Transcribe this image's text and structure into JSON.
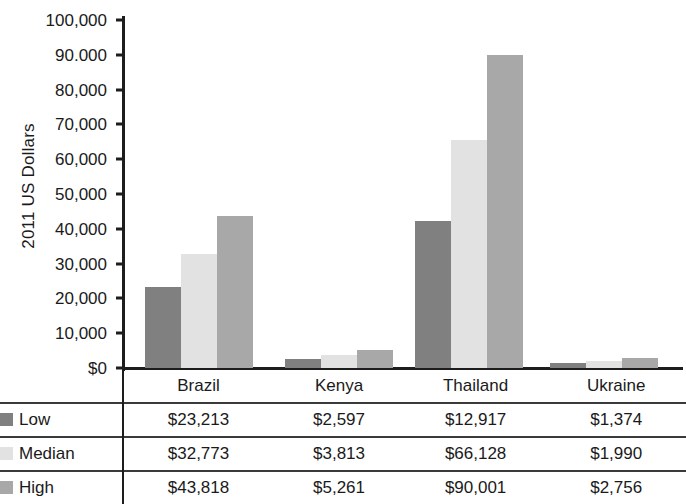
{
  "chart_data": {
    "type": "bar",
    "title": "",
    "subtitle": "",
    "xlabel": "",
    "ylabel": "2011 US Dollars",
    "ylim": [
      0,
      100000
    ],
    "ytick_interval": 10000,
    "ytick_labels": [
      "100,000",
      "90.000",
      "80,000",
      "70,000",
      "60,000",
      "50,000",
      "40,000",
      "30,000",
      "20,000",
      "10,000",
      "$0"
    ],
    "ytick_values": [
      100000,
      90000,
      80000,
      70000,
      60000,
      50000,
      40000,
      30000,
      20000,
      10000,
      0
    ],
    "grid": false,
    "legend_position": "table-row-labels",
    "categories": [
      "Brazil",
      "Kenya",
      "Thailand",
      "Ukraine"
    ],
    "series": [
      {
        "name": "Low",
        "color": "#808080",
        "values": [
          23213,
          2597,
          12917,
          1374
        ],
        "bar_values": [
          23213,
          2597,
          42300,
          1374
        ],
        "labels": [
          "$23,213",
          "$2,597",
          "$12,917",
          "$1,374"
        ]
      },
      {
        "name": "Median",
        "color": "#e2e2e2",
        "values": [
          32773,
          3813,
          66128,
          1990
        ],
        "bar_values": [
          32773,
          3813,
          65500,
          1990
        ],
        "labels": [
          "$32,773",
          "$3,813",
          "$66,128",
          "$1,990"
        ]
      },
      {
        "name": "High",
        "color": "#a8a8a8",
        "values": [
          43818,
          5261,
          90001,
          2756
        ],
        "bar_values": [
          43818,
          5261,
          90001,
          2756
        ],
        "labels": [
          "$43,818",
          "$5,261",
          "$90,001",
          "$2,756"
        ]
      }
    ]
  },
  "table": {
    "corner_label": "",
    "column_headers": [
      "Brazil",
      "Kenya",
      "Thailand",
      "Ukraine"
    ],
    "rows": [
      {
        "label": "Low",
        "swatch": "#808080",
        "cells": [
          "$23,213",
          "$2,597",
          "$12,917",
          "$1,374"
        ]
      },
      {
        "label": "Median",
        "swatch": "#e2e2e2",
        "cells": [
          "$32,773",
          "$3,813",
          "$66,128",
          "$1,990"
        ]
      },
      {
        "label": "High",
        "swatch": "#a8a8a8",
        "cells": [
          "$43,818",
          "$5,261",
          "$90,001",
          "$2,756"
        ]
      }
    ]
  }
}
